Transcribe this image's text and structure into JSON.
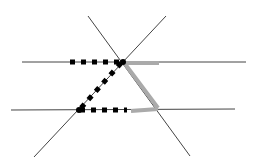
{
  "diagram": {
    "colors": {
      "background": "#ffffff",
      "thin_line": "#444444",
      "dashed_z": "#000000",
      "gray_z": "#aaaaaa"
    },
    "parallel_lines": [
      {
        "id": "top-parallel-line",
        "x1": 22,
        "y1": 62,
        "x2": 246,
        "y2": 62
      },
      {
        "id": "bottom-parallel-line",
        "x1": 11,
        "y1": 110,
        "x2": 235,
        "y2": 109
      }
    ],
    "transversals": [
      {
        "id": "transversal-descending",
        "x1": 88,
        "y1": 16,
        "x2": 190,
        "y2": 156
      },
      {
        "id": "transversal-ascending",
        "x1": 166,
        "y1": 16,
        "x2": 34,
        "y2": 157
      }
    ],
    "intersections": [
      {
        "id": "top-intersection",
        "x": 123,
        "y": 62
      },
      {
        "id": "bottom-left-intersection",
        "x": 79,
        "y": 110
      },
      {
        "id": "bottom-right-intersection",
        "x": 159,
        "y": 109
      }
    ],
    "dashed_z": {
      "label": "Z-figure (dashed black)",
      "segments": [
        {
          "x1": 70,
          "y1": 62,
          "x2": 122,
          "y2": 62
        },
        {
          "x1": 121,
          "y1": 63,
          "x2": 80,
          "y2": 109
        },
        {
          "x1": 80,
          "y1": 110,
          "x2": 127,
          "y2": 110
        }
      ]
    },
    "gray_z": {
      "label": "Z-figure (solid gray)",
      "segments": [
        {
          "x1": 123,
          "y1": 63,
          "x2": 159,
          "y2": 63
        },
        {
          "x1": 125,
          "y1": 64,
          "x2": 158,
          "y2": 108
        },
        {
          "x1": 158,
          "y1": 109,
          "x2": 131,
          "y2": 111
        }
      ]
    }
  }
}
